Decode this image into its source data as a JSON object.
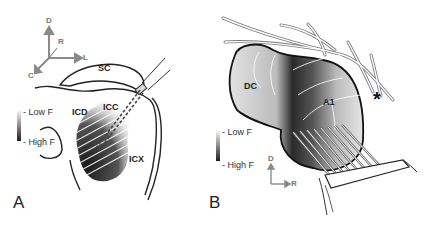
{
  "panel_a": {
    "letter": "A",
    "axes": {
      "dorsal": "D",
      "rostral": "R",
      "lateral": "L",
      "caudal": "C"
    },
    "regions": {
      "sc": "SC",
      "icd": "ICD",
      "icc": "ICC",
      "icx": "ICX"
    },
    "legend": {
      "low": "- Low F",
      "high": "- High F"
    }
  },
  "panel_b": {
    "letter": "B",
    "axes": {
      "dorsal": "D",
      "rostral": "R"
    },
    "regions": {
      "dc": "DC",
      "a1": "A1"
    },
    "marker": "*",
    "legend": {
      "low": "- Low F",
      "high": "- High F"
    }
  },
  "colors": {
    "outline": "#222222",
    "axis_arrow": "#8a8a8a",
    "gradient_light": "#f2f2f2",
    "gradient_dark": "#1e1e1e"
  }
}
